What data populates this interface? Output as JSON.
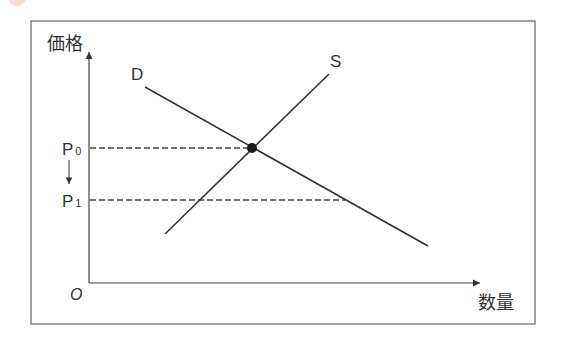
{
  "diagram": {
    "type": "supply-demand",
    "axes": {
      "y_label": "価格",
      "x_label": "数量",
      "origin_label": "O"
    },
    "curves": [
      {
        "name": "D",
        "label": "D",
        "from": [
          145,
          87
        ],
        "to": [
          428,
          246
        ]
      },
      {
        "name": "S",
        "label": "S",
        "from": [
          165,
          234
        ],
        "to": [
          329,
          74
        ]
      }
    ],
    "equilibrium_point": [
      252,
      148
    ],
    "price_levels": [
      {
        "label_main": "P",
        "label_sub": "0",
        "y": 148,
        "x_end": 252
      },
      {
        "label_main": "P",
        "label_sub": "1",
        "y": 200,
        "x_end": 345
      }
    ],
    "arrow_note": "P0 → P1 (price decrease)",
    "colors": {
      "line": "#333333",
      "frame": "#555555",
      "background": "#ffffff"
    }
  }
}
